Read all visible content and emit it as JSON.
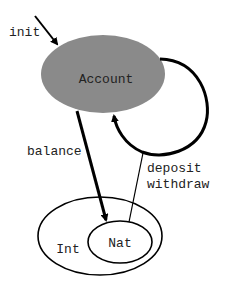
{
  "diagram": {
    "type": "state-diagram",
    "nodes": [
      {
        "id": "account",
        "label": "Account",
        "fill": "#8a8a8a",
        "shape": "ellipse"
      },
      {
        "id": "int",
        "label": "Int",
        "fill": "#ffffff",
        "shape": "ellipse"
      },
      {
        "id": "nat",
        "label": "Nat",
        "fill": "#ffffff",
        "shape": "ellipse",
        "inside": "int"
      }
    ],
    "edges": [
      {
        "id": "init",
        "label": "init",
        "from": null,
        "to": "account",
        "style": "thick-arrow"
      },
      {
        "id": "balance",
        "label": "balance",
        "from": "account",
        "to": "nat",
        "style": "thick-arrow"
      },
      {
        "id": "deposit-withdraw",
        "label_lines": [
          "deposit",
          "withdraw"
        ],
        "from": "nat",
        "to": "account",
        "via": "self-loop",
        "style": "thin-line-to-loop"
      },
      {
        "id": "self-loop",
        "label": "",
        "from": "account",
        "to": "account",
        "style": "thick-arrow"
      }
    ],
    "labels": {
      "init": "init",
      "account": "Account",
      "balance": "balance",
      "deposit": "deposit",
      "withdraw": "withdraw",
      "int": "Int",
      "nat": "Nat"
    },
    "colors": {
      "account_fill": "#8a8a8a",
      "stroke": "#000000",
      "text": "#222222",
      "background": "#ffffff"
    }
  }
}
